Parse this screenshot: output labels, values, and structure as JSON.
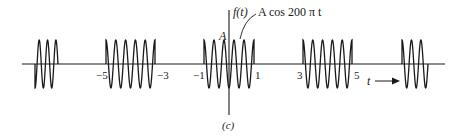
{
  "figure": {
    "function_label": "f(t)",
    "amplitude_label": "A",
    "carrier_label": "A cos 200 π t",
    "time_axis_label": "t",
    "panel_label": "(c)",
    "tick_labels": [
      "−5",
      "−3",
      "−1",
      "1",
      "3",
      "5"
    ],
    "colors": {
      "stroke": "#1a1a1a",
      "background": "#ffffff"
    }
  },
  "signal": {
    "type": "gated cosine burst train",
    "carrier": "A cos 200πt",
    "bursts": [
      {
        "start": -7,
        "end": -5,
        "partial": true
      },
      {
        "start": -5,
        "end": -3
      },
      {
        "start": -1,
        "end": 1
      },
      {
        "start": 3,
        "end": 5
      },
      {
        "start": 7,
        "end": 9,
        "partial": true
      }
    ]
  }
}
